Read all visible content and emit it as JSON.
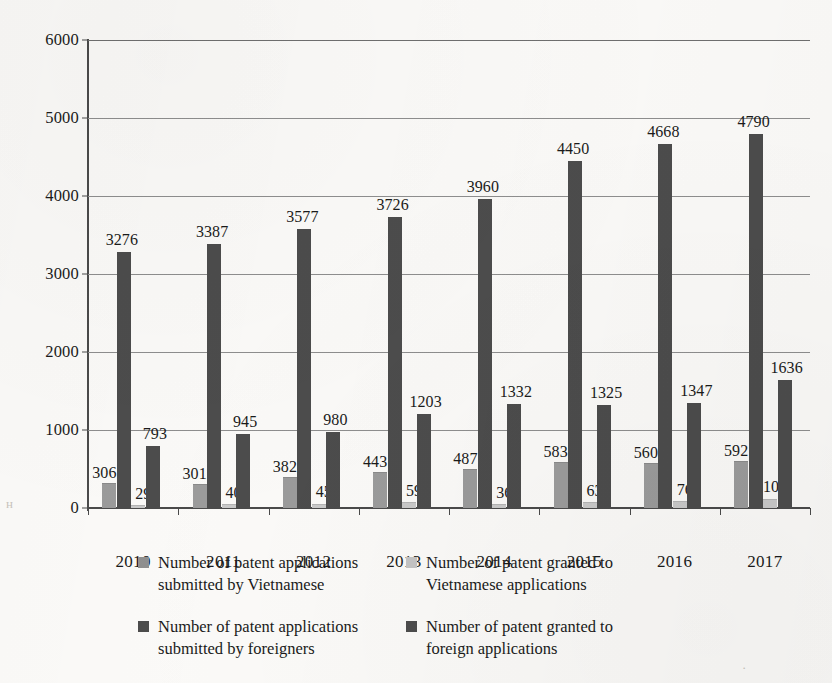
{
  "chart_data": {
    "type": "bar",
    "title": "",
    "subtitle": "",
    "xlabel": "",
    "ylabel": "",
    "grid": true,
    "legend_position": "bottom",
    "ylim": [
      0,
      6000
    ],
    "ytick_labels": [
      "0",
      "1000",
      "2000",
      "3000",
      "4000",
      "5000",
      "6000"
    ],
    "yticks": [
      0,
      1000,
      2000,
      3000,
      4000,
      5000,
      6000
    ],
    "categories": [
      "2010",
      "2011",
      "2012",
      "2013",
      "2014",
      "2015",
      "2016",
      "2017"
    ],
    "series": [
      {
        "name": "Number of patent applications submitted by Vietnamese",
        "label_line1": "Number of patent applications",
        "label_line2": "submitted by Vietnamese",
        "color": "#9b9b9b",
        "values": [
          306,
          301,
          382,
          443,
          487,
          583,
          560,
          592
        ]
      },
      {
        "name": "Number of patent applications submitted by foreigners",
        "label_line1": "Number of patent applications",
        "label_line2": "submitted by foreigners",
        "color": "#4c4c4c",
        "values": [
          3276,
          3387,
          3577,
          3726,
          3960,
          4450,
          4668,
          4790
        ]
      },
      {
        "name": "Number of patent granted to Vietnamese applications",
        "label_line1": "Number of patent granted to",
        "label_line2": "Vietnamese applications",
        "color": "#c9c9c9",
        "values": [
          29,
          40,
          45,
          59,
          36,
          63,
          76,
          109
        ]
      },
      {
        "name": "Number of patent granted to foreign applications",
        "label_line1": "Number of patent granted to",
        "label_line2": "foreign applications",
        "color": "#4c4c4c",
        "values": [
          793,
          945,
          980,
          1203,
          1332,
          1325,
          1347,
          1636
        ]
      }
    ]
  }
}
